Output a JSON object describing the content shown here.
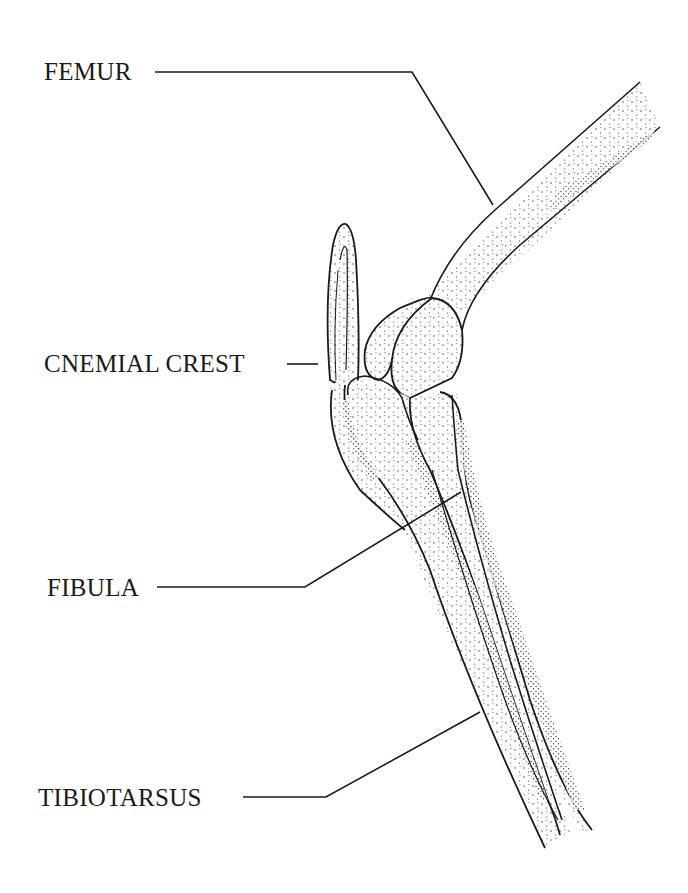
{
  "diagram": {
    "ink_color": "#1a1a1a",
    "background": "#ffffff",
    "labels": [
      {
        "id": "femur",
        "text": "FEMUR"
      },
      {
        "id": "cnemial-crest",
        "text": "CNEMIAL CREST"
      },
      {
        "id": "fibula",
        "text": "FIBULA"
      },
      {
        "id": "tibiotarsus",
        "text": "TIBIOTARSUS"
      }
    ]
  }
}
